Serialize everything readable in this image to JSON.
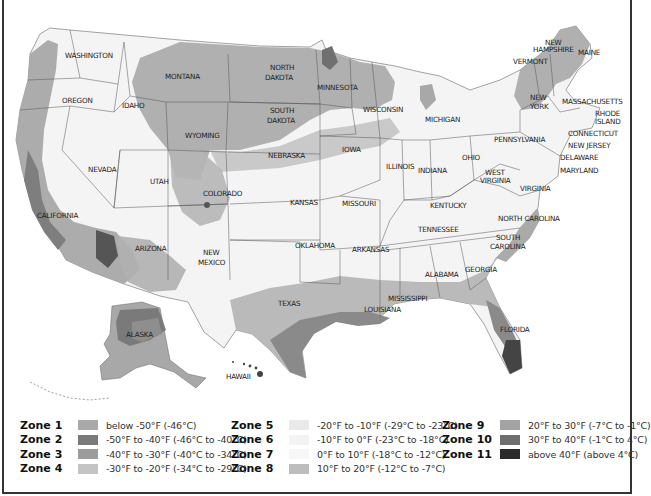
{
  "map": {
    "title": "USDA Plant Hardiness Zone Map",
    "state_labels": [
      {
        "name": "WASHINGTON",
        "x": 65,
        "y": 58
      },
      {
        "name": "OREGON",
        "x": 62,
        "y": 103
      },
      {
        "name": "IDAHO",
        "x": 122,
        "y": 108
      },
      {
        "name": "MONTANA",
        "x": 165,
        "y": 79
      },
      {
        "name": "WYOMING",
        "x": 185,
        "y": 138
      },
      {
        "name": "NORTH",
        "x": 270,
        "y": 70
      },
      {
        "name": "DAKOTA",
        "x": 265,
        "y": 80
      },
      {
        "name": "SOUTH",
        "x": 270,
        "y": 113
      },
      {
        "name": "DAKOTA",
        "x": 267,
        "y": 123
      },
      {
        "name": "MINNESOTA",
        "x": 317,
        "y": 90
      },
      {
        "name": "WISCONSIN",
        "x": 363,
        "y": 112
      },
      {
        "name": "MICHIGAN",
        "x": 425,
        "y": 122
      },
      {
        "name": "NEW",
        "x": 545,
        "y": 45
      },
      {
        "name": "HAMPSHIRE",
        "x": 533,
        "y": 52
      },
      {
        "name": "MAINE",
        "x": 578,
        "y": 55
      },
      {
        "name": "VERMONT",
        "x": 513,
        "y": 64
      },
      {
        "name": "NEW",
        "x": 530,
        "y": 100
      },
      {
        "name": "YORK",
        "x": 530,
        "y": 109
      },
      {
        "name": "MASSACHUSETTS",
        "x": 562,
        "y": 104
      },
      {
        "name": "RHODE",
        "x": 595,
        "y": 116
      },
      {
        "name": "ISLAND",
        "x": 595,
        "y": 124
      },
      {
        "name": "CONNECTICUT",
        "x": 568,
        "y": 136
      },
      {
        "name": "NEW JERSEY",
        "x": 568,
        "y": 148
      },
      {
        "name": "DELAWARE",
        "x": 560,
        "y": 160
      },
      {
        "name": "MARYLAND",
        "x": 560,
        "y": 173
      },
      {
        "name": "PENNSYLVANIA",
        "x": 494,
        "y": 142
      },
      {
        "name": "NEVADA",
        "x": 88,
        "y": 172
      },
      {
        "name": "UTAH",
        "x": 150,
        "y": 184
      },
      {
        "name": "COLORADO",
        "x": 203,
        "y": 196
      },
      {
        "name": "NEBRASKA",
        "x": 268,
        "y": 158
      },
      {
        "name": "IOWA",
        "x": 342,
        "y": 152
      },
      {
        "name": "ILLINOIS",
        "x": 386,
        "y": 169
      },
      {
        "name": "INDIANA",
        "x": 418,
        "y": 173
      },
      {
        "name": "OHIO",
        "x": 462,
        "y": 160
      },
      {
        "name": "WEST",
        "x": 485,
        "y": 175
      },
      {
        "name": "VIRGINIA",
        "x": 480,
        "y": 183
      },
      {
        "name": "VIRGINIA",
        "x": 520,
        "y": 191
      },
      {
        "name": "KANSAS",
        "x": 290,
        "y": 205
      },
      {
        "name": "MISSOURI",
        "x": 342,
        "y": 206
      },
      {
        "name": "KENTUCKY",
        "x": 430,
        "y": 208
      },
      {
        "name": "CALIFORNIA",
        "x": 37,
        "y": 218
      },
      {
        "name": "NORTH CAROLINA",
        "x": 498,
        "y": 221
      },
      {
        "name": "TENNESSEE",
        "x": 418,
        "y": 232
      },
      {
        "name": "SOUTH",
        "x": 496,
        "y": 240
      },
      {
        "name": "CAROLINA",
        "x": 490,
        "y": 249
      },
      {
        "name": "ARIZONA",
        "x": 135,
        "y": 251
      },
      {
        "name": "NEW",
        "x": 203,
        "y": 255
      },
      {
        "name": "MEXICO",
        "x": 198,
        "y": 265
      },
      {
        "name": "OKLAHOMA",
        "x": 295,
        "y": 248
      },
      {
        "name": "ARKANSAS",
        "x": 352,
        "y": 252
      },
      {
        "name": "ALABAMA",
        "x": 425,
        "y": 277
      },
      {
        "name": "GEORGIA",
        "x": 465,
        "y": 272
      },
      {
        "name": "MISSISSIPPI",
        "x": 388,
        "y": 301
      },
      {
        "name": "LOUISIANA",
        "x": 364,
        "y": 312
      },
      {
        "name": "TEXAS",
        "x": 278,
        "y": 306
      },
      {
        "name": "FLORIDA",
        "x": 500,
        "y": 332
      },
      {
        "name": "ALASKA",
        "x": 126,
        "y": 337
      },
      {
        "name": "HAWAII",
        "x": 226,
        "y": 379
      }
    ]
  },
  "legend": {
    "columns": [
      [
        {
          "zone": "Zone 1",
          "range": "below -50°F (-46°C)",
          "color": "#a9a9a9"
        },
        {
          "zone": "Zone 2",
          "range": "-50°F to -40°F (-46°C to -40°C)",
          "color": "#7a7a7a"
        },
        {
          "zone": "Zone 3",
          "range": "-40°F to -30°F (-40°C to -34°C)",
          "color": "#9c9c9c"
        },
        {
          "zone": "Zone 4",
          "range": "-30°F to -20°F (-34°C to -29°C)",
          "color": "#c4c4c4"
        }
      ],
      [
        {
          "zone": "Zone 5",
          "range": "-20°F to -10°F (-29°C to -23°C)",
          "color": "#e9e9e9"
        },
        {
          "zone": "Zone 6",
          "range": "-10°F to 0°F (-23°C to -18°C)",
          "color": "#f3f3f3"
        },
        {
          "zone": "Zone 7",
          "range": "0°F to 10°F (-18°C to -12°C)",
          "color": "#f7f7f7"
        },
        {
          "zone": "Zone 8",
          "range": "10°F to 20°F (-12°C to -7°C)",
          "color": "#bdbdbd"
        }
      ],
      [
        {
          "zone": "Zone 9",
          "range": "20°F to 30°F (-7°C to -1°C)",
          "color": "#a3a3a3"
        },
        {
          "zone": "Zone 10",
          "range": "30°F to 40°F (-1°C to 4°C)",
          "color": "#6e6e6e"
        },
        {
          "zone": "Zone 11",
          "range": "above 40°F (above 4°C)",
          "color": "#2a2a2a"
        }
      ]
    ]
  }
}
